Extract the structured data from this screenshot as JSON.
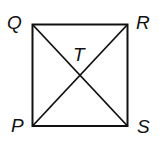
{
  "diagram": {
    "type": "square-with-diagonals",
    "stroke_color": "#111111",
    "background": "#ffffff",
    "vertices": [
      {
        "label": "Q",
        "position": "top-left"
      },
      {
        "label": "R",
        "position": "top-right"
      },
      {
        "label": "S",
        "position": "bottom-right"
      },
      {
        "label": "P",
        "position": "bottom-left"
      }
    ],
    "intersection": {
      "label": "T"
    },
    "segments": [
      "QR",
      "RS",
      "SP",
      "PQ",
      "QS",
      "PR"
    ]
  }
}
